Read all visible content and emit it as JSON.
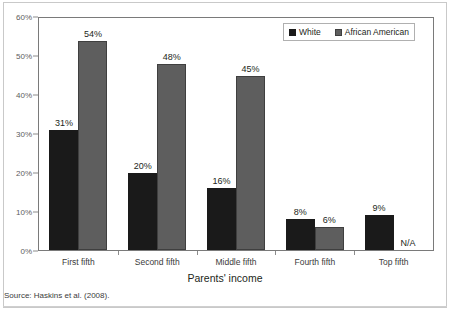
{
  "chart_data": {
    "type": "bar",
    "title": "",
    "subtitle": "",
    "xlabel": "Parents' income",
    "ylabel": "",
    "categories": [
      "First fifth",
      "Second fifth",
      "Middle fifth",
      "Fourth fifth",
      "Top fifth"
    ],
    "series": [
      {
        "name": "White",
        "color": "#1a1a1a",
        "values": [
          31,
          20,
          16,
          8,
          9
        ],
        "value_labels": [
          "31%",
          "20%",
          "16%",
          "8%",
          "9%"
        ]
      },
      {
        "name": "African American",
        "color": "#5e5e5e",
        "values": [
          54,
          48,
          45,
          6,
          null
        ],
        "value_labels": [
          "54%",
          "48%",
          "45%",
          "6%",
          "N/A"
        ]
      }
    ],
    "ylim": [
      0,
      60
    ],
    "yticks": [
      0,
      10,
      20,
      30,
      40,
      50,
      60
    ],
    "ytick_labels": [
      "0%",
      "10%",
      "20%",
      "30%",
      "40%",
      "50%",
      "60%"
    ],
    "grid": false,
    "legend_position": "top-right",
    "annotations": [
      "N/A"
    ],
    "source_note": "Source: Haskins et al. (2008)."
  },
  "legend": {
    "items": [
      {
        "label": "White",
        "swatch": "black-square-icon"
      },
      {
        "label": "African American",
        "swatch": "gray-square-icon"
      }
    ]
  },
  "axis": {
    "x_title": "Parents' income"
  },
  "footer": {
    "source": "Source: Haskins et al. (2008)."
  }
}
